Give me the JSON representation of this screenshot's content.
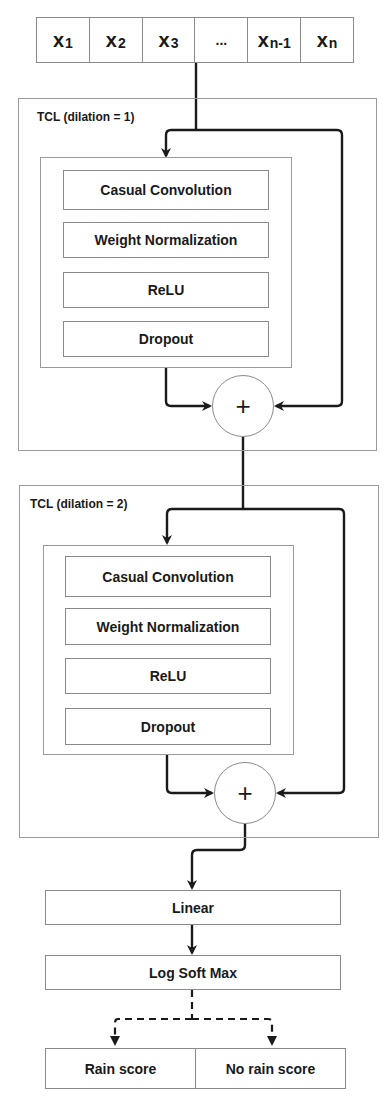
{
  "input_sequence": {
    "cells": [
      {
        "base": "x",
        "sub": "1"
      },
      {
        "base": "x",
        "sub": "2"
      },
      {
        "base": "x",
        "sub": "3"
      },
      {
        "base": "...",
        "sub": ""
      },
      {
        "base": "x",
        "sub": "n-1"
      },
      {
        "base": "x",
        "sub": "n"
      }
    ]
  },
  "tcl_blocks": [
    {
      "label": "TCL (dilation = 1)",
      "layers": [
        "Casual Convolution",
        "Weight Normalization",
        "ReLU",
        "Dropout"
      ],
      "sum_symbol": "+"
    },
    {
      "label": "TCL (dilation = 2)",
      "layers": [
        "Casual Convolution",
        "Weight Normalization",
        "ReLU",
        "Dropout"
      ],
      "sum_symbol": "+"
    }
  ],
  "head": {
    "linear": "Linear",
    "log_softmax": "Log Soft Max"
  },
  "outputs": [
    "Rain score",
    "No rain score"
  ],
  "colors": {
    "line": "#1a1a1a",
    "border": "#8a8a8a",
    "background": "#ffffff"
  }
}
